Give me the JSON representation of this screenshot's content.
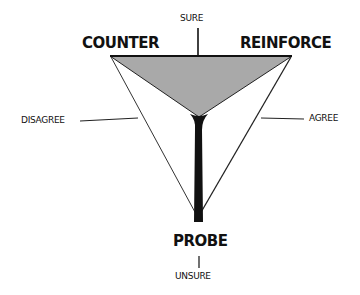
{
  "diagram": {
    "corners": {
      "top_left": "COUNTER",
      "top_right": "REINFORCE",
      "bottom": "PROBE"
    },
    "axes": {
      "top": "SURE",
      "bottom": "UNSURE",
      "left": "DISAGREE",
      "right": "AGREE"
    },
    "colors": {
      "fill": "#a9a9a9",
      "ink": "#111111",
      "background": "#ffffff"
    }
  }
}
